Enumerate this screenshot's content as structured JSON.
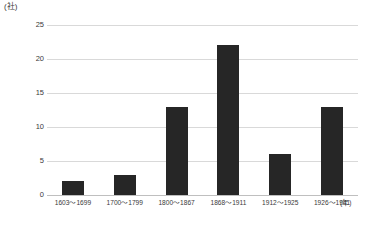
{
  "chart_data": {
    "type": "bar",
    "title": "",
    "subtitle": "",
    "xlabel": "(年)",
    "ylabel": "(社)",
    "categories": [
      "1603〜1699",
      "1700〜1799",
      "1800〜1867",
      "1868〜1911",
      "1912〜1925",
      "1926〜1941"
    ],
    "values": [
      2,
      3,
      13,
      22,
      6,
      13
    ],
    "ylim": [
      0,
      25
    ],
    "y_ticks": [
      0,
      5,
      10,
      15,
      20,
      25
    ],
    "y_tick_labels": [
      "0",
      "5",
      "10",
      "15",
      "20",
      "25"
    ],
    "grid": true,
    "legend": false,
    "legend_position": "none",
    "bar_color": "#262626",
    "gridline_color": "#d9d9d9",
    "axis_line_color": "#bfbfbf",
    "background_color": "#ffffff"
  },
  "axes": {
    "y_unit_label": "(社)",
    "x_unit_label": "(年)"
  }
}
